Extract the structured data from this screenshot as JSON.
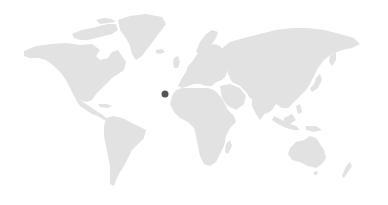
{
  "map": {
    "type": "world-map",
    "land_color": "#e2e2e2",
    "background_color": "#ffffff",
    "regions": [
      "north-america",
      "greenland",
      "canadian-arctic",
      "central-america",
      "south-america",
      "europe",
      "africa",
      "madagascar",
      "asia",
      "japan",
      "southeast-asia",
      "australia",
      "new-zealand",
      "uk",
      "iceland"
    ],
    "markers": [
      {
        "id": "marker-1",
        "label": "",
        "x": 165,
        "y": 94,
        "color": "#555555",
        "radius": 3.5,
        "approx_location": "Canary Islands"
      }
    ]
  }
}
